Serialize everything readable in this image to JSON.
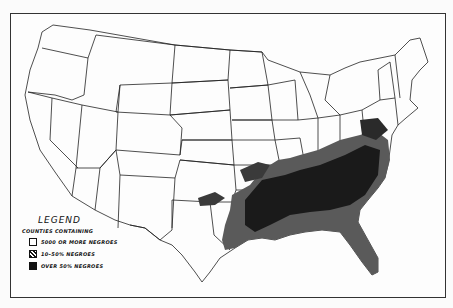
{
  "map": {
    "subject": "Counties by Negro population, United States",
    "legend": {
      "title": "LEGEND",
      "subtitle": "COUNTIES CONTAINING",
      "items": [
        {
          "label": "5000 OR MORE NEGROES",
          "pattern": "white-outline",
          "color": "#ffffff"
        },
        {
          "label": "10–50% NEGROES",
          "pattern": "hatched",
          "color": "#555555"
        },
        {
          "label": "OVER 50% NEGROES",
          "pattern": "solid",
          "color": "#111111"
        }
      ]
    },
    "colors": {
      "background": "#fbfbfb",
      "state_lines": "#222222",
      "dense_region": "#1a1a1a",
      "hatched_region": "#5a5a5a"
    }
  }
}
